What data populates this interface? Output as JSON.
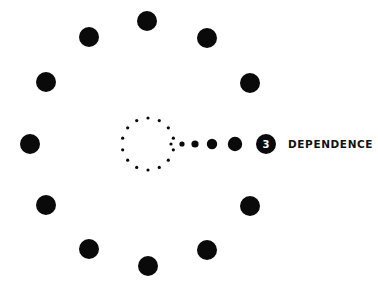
{
  "diagram": {
    "colors": {
      "dot": "#0a0a0a",
      "background": "#ffffff",
      "badge_text": "#ffffff"
    },
    "outer_ring": {
      "center": [
        148,
        144
      ],
      "dots": [
        [
          147,
          21
        ],
        [
          207,
          38
        ],
        [
          250,
          83
        ],
        [
          265,
          144
        ],
        [
          250,
          206
        ],
        [
          207,
          250
        ],
        [
          148,
          266
        ],
        [
          89,
          249
        ],
        [
          46,
          205
        ],
        [
          30,
          144
        ],
        [
          46,
          82
        ],
        [
          89,
          37
        ]
      ],
      "dot_radius": 10,
      "note": "right-side position (265,144) is occupied by the numbered badge"
    },
    "inner_ring": {
      "center": [
        148,
        144
      ],
      "radius": 26,
      "count": 14,
      "dot_radius": 1.6
    },
    "trail": [
      {
        "x": 171,
        "r": 1.6
      },
      {
        "x": 182,
        "r": 2.6
      },
      {
        "x": 195,
        "r": 3.6
      },
      {
        "x": 212,
        "r": 5.2
      },
      {
        "x": 235,
        "r": 7.2
      }
    ],
    "badge": {
      "number": "3",
      "x": 266,
      "y": 144,
      "r": 10
    },
    "label": "DEPENDENCE"
  }
}
